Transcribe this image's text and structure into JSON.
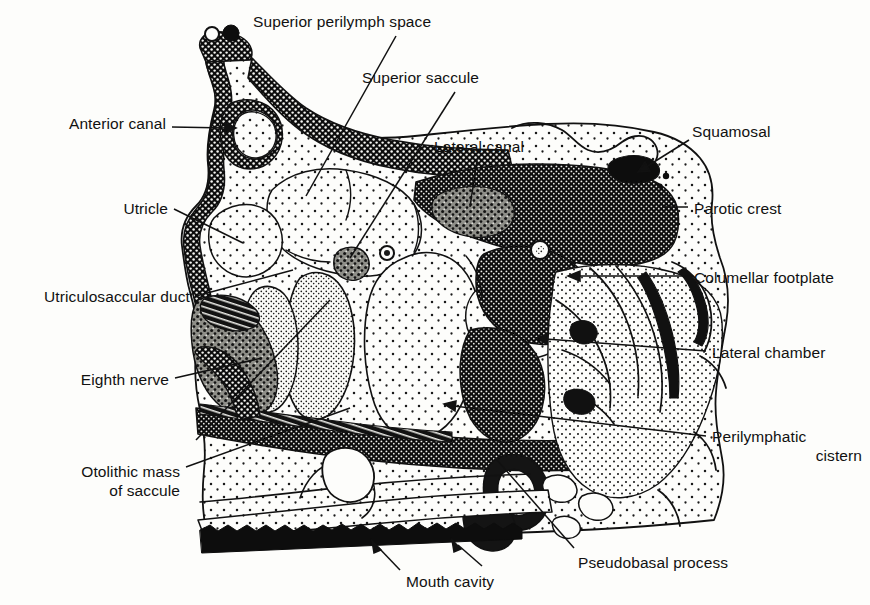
{
  "figure": {
    "type": "anatomical-illustration",
    "background_color": "#fdfdfb",
    "ink_color": "#111111",
    "labels": [
      {
        "id": "superior-perilymph-space",
        "text": "Superior perilymph space",
        "align": "left",
        "x": 253,
        "y": 12,
        "leader": "line",
        "from": [
          396,
          36
        ],
        "to": [
          306,
          196
        ]
      },
      {
        "id": "superior-saccule",
        "text": "Superior saccule",
        "align": "left",
        "x": 362,
        "y": 68,
        "leader": "line",
        "from": [
          455,
          92
        ],
        "to": [
          350,
          258
        ]
      },
      {
        "id": "anterior-canal",
        "text": "Anterior canal",
        "align": "right",
        "x": 68,
        "y": 114,
        "leader": "arrow",
        "from": [
          172,
          127
        ],
        "to": [
          232,
          128
        ]
      },
      {
        "id": "lateral-canal",
        "text": "Lateral canal",
        "align": "left",
        "x": 434,
        "y": 137,
        "leader": "line",
        "from": [
          477,
          160
        ],
        "to": [
          470,
          210
        ]
      },
      {
        "id": "squamosal",
        "text": "Squamosal",
        "align": "left",
        "x": 692,
        "y": 122,
        "leader": "arrow",
        "from": [
          689,
          140
        ],
        "to": [
          640,
          170
        ]
      },
      {
        "id": "parotic-crest",
        "text": "Parotic crest",
        "align": "left",
        "x": 694,
        "y": 199,
        "leader": "line",
        "from": [
          688,
          207
        ],
        "to": [
          664,
          207
        ]
      },
      {
        "id": "utricle",
        "text": "Utricle",
        "align": "right",
        "x": 108,
        "y": 199,
        "leader": "line",
        "from": [
          174,
          209
        ],
        "to": [
          243,
          243
        ]
      },
      {
        "id": "utriculosaccular-duct",
        "text": "Utriculosaccular duct",
        "align": "right",
        "x": 16,
        "y": 287,
        "leader": "line",
        "from": [
          196,
          296
        ],
        "to": [
          289,
          272
        ]
      },
      {
        "id": "columellar-footplate",
        "text": "Columellar footplate",
        "align": "left",
        "x": 694,
        "y": 268,
        "leader": "arrow",
        "from": [
          688,
          276
        ],
        "to": [
          570,
          276
        ]
      },
      {
        "id": "eighth-nerve",
        "text": "Eighth nerve",
        "align": "right",
        "x": 58,
        "y": 370,
        "leader": "line",
        "from": [
          175,
          378
        ],
        "to": [
          258,
          360
        ]
      },
      {
        "id": "lateral-chamber",
        "text": "Lateral chamber",
        "align": "left",
        "x": 712,
        "y": 343,
        "leader": "arrow",
        "from": [
          706,
          351
        ],
        "to": [
          536,
          338
        ]
      },
      {
        "id": "otolithic-mass-of-saccule",
        "text": "Otolithic mass\nof saccule",
        "align": "right",
        "x": 30,
        "y": 462,
        "leader": "line",
        "from": [
          186,
          467
        ],
        "to": [
          345,
          410
        ]
      },
      {
        "id": "perilymphatic-cistern",
        "text": "Perilymphatic\ncistern",
        "align": "left",
        "x": 712,
        "y": 427,
        "leader": "arrow",
        "from": [
          706,
          436
        ],
        "to": [
          444,
          404
        ]
      },
      {
        "id": "pseudobasal-process",
        "text": "Pseudobasal process",
        "align": "left",
        "x": 578,
        "y": 553,
        "leader": "line",
        "from": [
          574,
          552
        ],
        "to": [
          488,
          452
        ]
      },
      {
        "id": "mouth-cavity",
        "text": "Mouth cavity",
        "align": "left",
        "x": 406,
        "y": 572,
        "leader": "double-arrow",
        "from": [
          400,
          570
        ],
        "to": [
          372,
          542
        ],
        "from2": [
          482,
          566
        ],
        "to2": [
          452,
          540
        ]
      }
    ],
    "structures": [
      {
        "id": "anterior-canal-lumen",
        "name": "anterior canal",
        "fill": "stipple-light"
      },
      {
        "id": "superior-perilymph-space",
        "name": "superior perilymph space",
        "fill": "stipple-light"
      },
      {
        "id": "utricle-chamber",
        "name": "utricle",
        "fill": "stipple-light"
      },
      {
        "id": "saccule-body",
        "name": "saccule",
        "fill": "stipple-light"
      },
      {
        "id": "otolithic-mass",
        "name": "otolithic mass of saccule",
        "fill": "stipple-dense"
      },
      {
        "id": "parotic-crest-bone",
        "name": "parotic crest",
        "fill": "reticulated-dark"
      },
      {
        "id": "columellar-footplate-bone",
        "name": "columellar footplate",
        "fill": "reticulated-dark"
      },
      {
        "id": "otic-capsule-wall",
        "name": "otic capsule wall",
        "fill": "reticulated-dark"
      },
      {
        "id": "lateral-chamber-space",
        "name": "lateral chamber",
        "fill": "stipple-light"
      },
      {
        "id": "perilymphatic-cistern-space",
        "name": "perilymphatic cistern",
        "fill": "stipple-light"
      },
      {
        "id": "pseudobasal-process-bone",
        "name": "pseudobasal process",
        "fill": "reticulated-dark"
      },
      {
        "id": "mouth-cavity-floor",
        "name": "mouth cavity floor epithelium",
        "fill": "dark-band"
      },
      {
        "id": "eighth-nerve-trunk",
        "name": "eighth nerve",
        "fill": "granular-mid"
      },
      {
        "id": "squamosal-bone",
        "name": "squamosal",
        "fill": "dark-blob"
      }
    ]
  }
}
